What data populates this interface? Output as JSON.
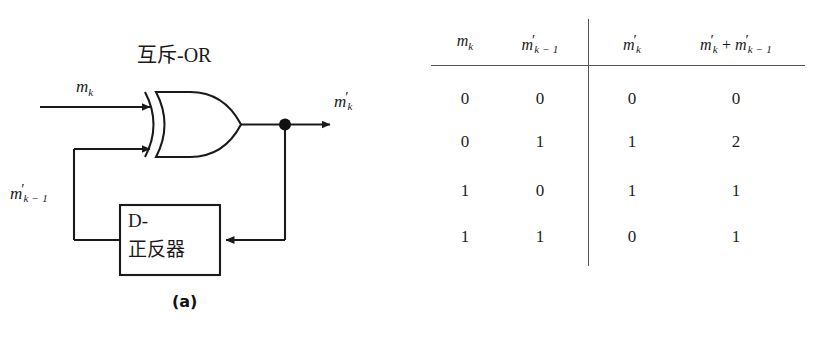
{
  "figure": {
    "panel_a": {
      "caption": "(a)",
      "gate_label": "互斥-OR",
      "gate_type": "xor-gate",
      "flipflop": {
        "line1": "D-",
        "line2": "正反器"
      },
      "signals": {
        "input_top": {
          "base": "m",
          "sub": "k",
          "prime": ""
        },
        "input_bottom": {
          "base": "m",
          "prime": "′",
          "sub": "k − 1"
        },
        "output": {
          "base": "m",
          "prime": "′",
          "sub": "k"
        }
      }
    },
    "panel_b": {
      "caption": "(b)",
      "table": {
        "headers": [
          {
            "base": "m",
            "prime": "",
            "sub": "k",
            "op": ""
          },
          {
            "base": "m",
            "prime": "′",
            "sub": "k − 1",
            "op": ""
          },
          {
            "base": "m",
            "prime": "′",
            "sub": "k",
            "op": ""
          },
          {
            "base": "m",
            "prime": "′",
            "sub": "k",
            "op": " + ",
            "base2": "m",
            "prime2": "′",
            "sub2": "k − 1"
          }
        ],
        "rows": [
          [
            "0",
            "0",
            "0",
            "0"
          ],
          [
            "0",
            "1",
            "1",
            "2"
          ],
          [
            "1",
            "0",
            "1",
            "1"
          ],
          [
            "1",
            "1",
            "0",
            "1"
          ]
        ]
      }
    }
  },
  "colors": {
    "ink": "#1a1a1a",
    "rule": "#555555",
    "background": "#ffffff"
  }
}
